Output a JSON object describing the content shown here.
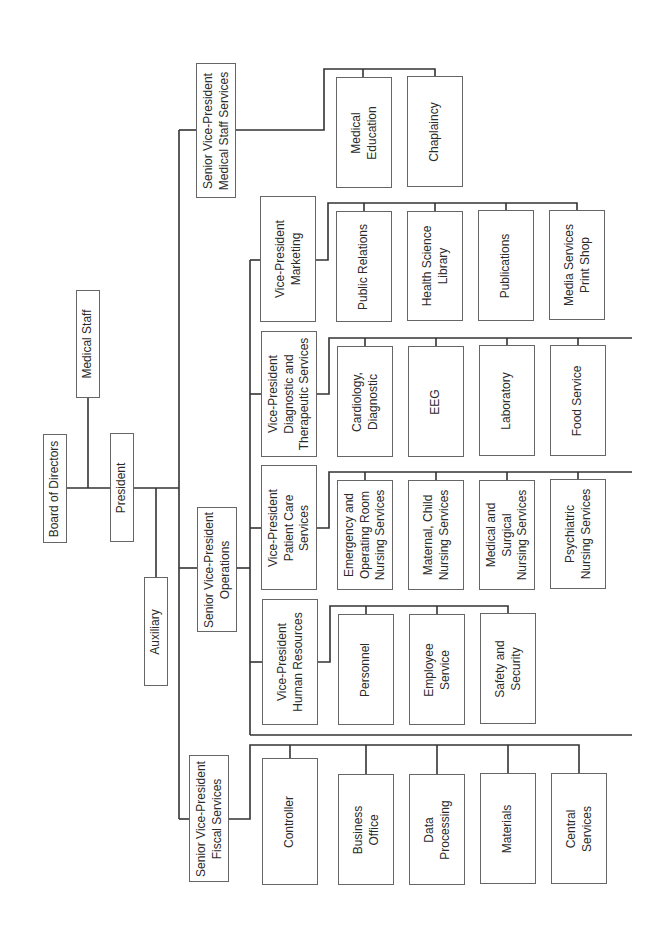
{
  "chart": {
    "orientation": "rotated-90-ccw",
    "line_color": "#333333",
    "box_border_color": "#666666",
    "nodes": {
      "board": {
        "label": "Board of Directors",
        "box": [
          43,
          434,
          24,
          109
        ]
      },
      "medical_staff": {
        "label": "Medical Staff",
        "box": [
          76,
          290,
          24,
          108
        ]
      },
      "president": {
        "label": "President",
        "box": [
          110,
          433,
          24,
          109
        ]
      },
      "auxiliary": {
        "label": "Auxiliary",
        "box": [
          144,
          577,
          24,
          109
        ]
      },
      "svp_medical_staff": {
        "label": "Senior Vice-President\nMedical Staff Services",
        "box": [
          196,
          63,
          40,
          135
        ]
      },
      "medical_education": {
        "label": "Medical\nEducation",
        "box": [
          336,
          77,
          56,
          111
        ]
      },
      "chaplaincy": {
        "label": "Chaplaincy",
        "box": [
          407,
          76,
          56,
          111
        ]
      },
      "svp_operations": {
        "label": "Senior Vice-President\nOperations",
        "box": [
          197,
          507,
          40,
          125
        ]
      },
      "vp_marketing": {
        "label": "Vice-President\nMarketing",
        "box": [
          260,
          196,
          56,
          126
        ]
      },
      "public_relations": {
        "label": "Public Relations",
        "box": [
          336,
          211,
          56,
          111
        ]
      },
      "health_science_library": {
        "label": "Health Science\nLibrary",
        "box": [
          407,
          211,
          56,
          110
        ]
      },
      "publications": {
        "label": "Publications",
        "box": [
          478,
          210,
          56,
          111
        ]
      },
      "media_services": {
        "label": "Media Services\nPrint Shop",
        "box": [
          549,
          210,
          56,
          110
        ]
      },
      "vp_diagnostic": {
        "label": "Vice-President\nDiagnostic and\nTherapeutic Services",
        "box": [
          261,
          331,
          56,
          126
        ]
      },
      "cardiology": {
        "label": "Cardiology,\nDiagnostic",
        "box": [
          337,
          346,
          56,
          111
        ]
      },
      "eeg": {
        "label": "EEG",
        "box": [
          408,
          346,
          56,
          111
        ]
      },
      "laboratory": {
        "label": "Laboratory",
        "box": [
          479,
          345,
          56,
          111
        ]
      },
      "food_service": {
        "label": "Food Service",
        "box": [
          550,
          345,
          56,
          111
        ]
      },
      "vp_patient_care": {
        "label": "Vice-President\nPatient Care\nServices",
        "box": [
          261,
          465,
          56,
          125
        ]
      },
      "emergency_or": {
        "label": "Emergency and\nOperating Room\nNursing Services",
        "box": [
          337,
          480,
          56,
          110
        ]
      },
      "maternal_child": {
        "label": "Maternal, Child\nNursing Services",
        "box": [
          408,
          480,
          56,
          110
        ]
      },
      "medical_surgical": {
        "label": "Medical and\nSurgical\nNursing Services",
        "box": [
          479,
          480,
          56,
          110
        ]
      },
      "psychiatric": {
        "label": "Psychiatric\nNursing Services",
        "box": [
          550,
          479,
          56,
          110
        ]
      },
      "vp_human_resources": {
        "label": "Vice-President\nHuman Resources",
        "box": [
          262,
          599,
          56,
          126
        ]
      },
      "personnel": {
        "label": "Personnel",
        "box": [
          338,
          614,
          56,
          111
        ]
      },
      "employee_service": {
        "label": "Employee\nService",
        "box": [
          409,
          614,
          56,
          111
        ]
      },
      "safety_security": {
        "label": "Safety and\nSecurity",
        "box": [
          480,
          613,
          56,
          111
        ]
      },
      "svp_fiscal": {
        "label": "Senior Vice-President\nFiscal Services",
        "box": [
          189,
          755,
          40,
          127
        ]
      },
      "controller": {
        "label": "Controller",
        "box": [
          262,
          758,
          56,
          127
        ]
      },
      "business_office": {
        "label": "Business\nOffice",
        "box": [
          338,
          774,
          56,
          111
        ]
      },
      "data_processing": {
        "label": "Data\nProcessing",
        "box": [
          409,
          774,
          56,
          111
        ]
      },
      "materials": {
        "label": "Materials",
        "box": [
          480,
          773,
          56,
          111
        ]
      },
      "central_services": {
        "label": "Central\nServices",
        "box": [
          551,
          773,
          56,
          111
        ]
      }
    },
    "edges": [
      [
        "board",
        "president"
      ],
      [
        "medical_staff",
        "president"
      ],
      [
        "president",
        "auxiliary"
      ],
      [
        "president",
        "svp_medical_staff"
      ],
      [
        "president",
        "svp_operations"
      ],
      [
        "president",
        "svp_fiscal"
      ],
      [
        "svp_medical_staff",
        "medical_education"
      ],
      [
        "svp_medical_staff",
        "chaplaincy"
      ],
      [
        "svp_operations",
        "vp_marketing"
      ],
      [
        "svp_operations",
        "vp_diagnostic"
      ],
      [
        "svp_operations",
        "vp_patient_care"
      ],
      [
        "svp_operations",
        "vp_human_resources"
      ],
      [
        "vp_marketing",
        "public_relations"
      ],
      [
        "vp_marketing",
        "health_science_library"
      ],
      [
        "vp_marketing",
        "publications"
      ],
      [
        "vp_marketing",
        "media_services"
      ],
      [
        "vp_diagnostic",
        "cardiology"
      ],
      [
        "vp_diagnostic",
        "eeg"
      ],
      [
        "vp_diagnostic",
        "laboratory"
      ],
      [
        "vp_diagnostic",
        "food_service"
      ],
      [
        "vp_patient_care",
        "emergency_or"
      ],
      [
        "vp_patient_care",
        "maternal_child"
      ],
      [
        "vp_patient_care",
        "medical_surgical"
      ],
      [
        "vp_patient_care",
        "psychiatric"
      ],
      [
        "vp_human_resources",
        "personnel"
      ],
      [
        "vp_human_resources",
        "employee_service"
      ],
      [
        "vp_human_resources",
        "safety_security"
      ],
      [
        "svp_fiscal",
        "controller"
      ],
      [
        "svp_fiscal",
        "business_office"
      ],
      [
        "svp_fiscal",
        "data_processing"
      ],
      [
        "svp_fiscal",
        "materials"
      ],
      [
        "svp_fiscal",
        "central_services"
      ]
    ]
  }
}
